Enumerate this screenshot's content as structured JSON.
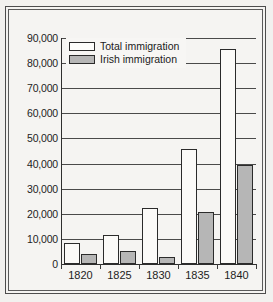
{
  "chart_data": {
    "type": "bar",
    "title": "",
    "xlabel": "",
    "ylabel": "",
    "ylim": [
      0,
      90000
    ],
    "ytick_step": 10000,
    "grid": true,
    "legend_position": "top-left",
    "categories": [
      "1820",
      "1825",
      "1830",
      "1835",
      "1840"
    ],
    "ytick_labels": [
      "90,000",
      "80,000",
      "70,000",
      "60,000",
      "50,000",
      "40,000",
      "30,000",
      "20,000",
      "10,000",
      "0"
    ],
    "ytick_values": [
      90000,
      80000,
      70000,
      60000,
      50000,
      40000,
      30000,
      20000,
      10000,
      0
    ],
    "series": [
      {
        "name": "Total immigration",
        "color": "#fbfaf8",
        "edge_color": "#2b2b2b",
        "values": [
          8300,
          11700,
          22500,
          46000,
          85500
        ]
      },
      {
        "name": "Irish immigration",
        "color": "#b6b6b6",
        "edge_color": "#2b2b2b",
        "values": [
          4000,
          5100,
          2700,
          20800,
          39500
        ]
      }
    ]
  },
  "legend": {
    "items": [
      {
        "label": "Total immigration",
        "swatch": "total"
      },
      {
        "label": "Irish immigration",
        "swatch": "irish"
      }
    ]
  }
}
